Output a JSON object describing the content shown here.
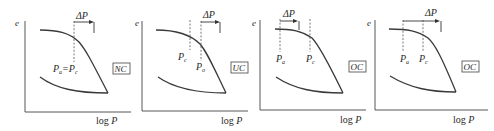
{
  "figure": {
    "panels": [
      {
        "id": "panel-1",
        "y_label": "e",
        "x_label": "log P",
        "delta_label": "ΔP",
        "point_labels": [
          {
            "main": "P",
            "sub": "a"
          },
          {
            "main": "=P",
            "sub": "c"
          }
        ],
        "state_label": "NC",
        "description": "normally consolidated: Pa = Pc"
      },
      {
        "id": "panel-2",
        "y_label": "e",
        "x_label": "log P",
        "delta_label": "ΔP",
        "point_labels": [
          {
            "main": "P",
            "sub": "c"
          },
          {
            "main": "P",
            "sub": "o"
          }
        ],
        "state_label": "UC",
        "description": "underconsolidated: Pc < Po"
      },
      {
        "id": "panel-3",
        "y_label": "e",
        "x_label": "log P",
        "delta_label": "ΔP",
        "point_labels": [
          {
            "main": "P",
            "sub": "a"
          },
          {
            "main": "P",
            "sub": "c"
          }
        ],
        "state_label": "OC",
        "description": "overconsolidated: Pa + ΔP < Pc"
      },
      {
        "id": "panel-4",
        "y_label": "e",
        "x_label": "log P",
        "delta_label": "ΔP",
        "point_labels": [
          {
            "main": "P",
            "sub": "a"
          },
          {
            "main": "P",
            "sub": "c"
          }
        ],
        "state_label": "OC",
        "description": "overconsolidated: Pa + ΔP > Pc"
      }
    ]
  }
}
